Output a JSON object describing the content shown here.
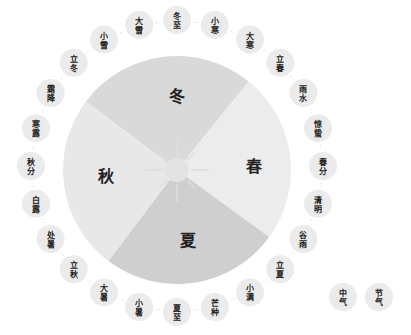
{
  "diagram": {
    "center": {
      "x": 177,
      "y": 170
    },
    "disc_radius": 114,
    "ring": {
      "cx": 177,
      "cy": 166,
      "r": 146,
      "bubble_r": 14
    },
    "colors": {
      "bubble": "#ebebeb",
      "connector": "#d6d6d6",
      "sun": "#e3e3e3",
      "sun_ray": "#dddddd",
      "text": "#222222"
    },
    "seasons": [
      {
        "id": "winter",
        "label": "冬",
        "start_deg": -53,
        "end_deg": 39,
        "color": "#d9d9d9",
        "label_x": 177,
        "label_y": 102
      },
      {
        "id": "spring",
        "label": "春",
        "start_deg": 39,
        "end_deg": 126,
        "color": "#ececec",
        "label_x": 254,
        "label_y": 172
      },
      {
        "id": "summer",
        "label": "夏",
        "start_deg": 126,
        "end_deg": 217,
        "color": "#cfcfcf",
        "label_x": 188,
        "label_y": 246
      },
      {
        "id": "autumn",
        "label": "秋",
        "start_deg": 217,
        "end_deg": 307,
        "color": "#e8e8e8",
        "label_x": 106,
        "label_y": 182
      }
    ],
    "solar_terms": [
      {
        "l1": "冬",
        "l2": "至",
        "type": "中气"
      },
      {
        "l1": "小",
        "l2": "寒",
        "type": "节气"
      },
      {
        "l1": "大",
        "l2": "寒",
        "type": "中气"
      },
      {
        "l1": "立",
        "l2": "春",
        "type": "节气"
      },
      {
        "l1": "雨",
        "l2": "水",
        "type": "中气"
      },
      {
        "l1": "惊",
        "l2": "蛰",
        "type": "节气"
      },
      {
        "l1": "春",
        "l2": "分",
        "type": "中气"
      },
      {
        "l1": "清",
        "l2": "明",
        "type": "节气"
      },
      {
        "l1": "谷",
        "l2": "雨",
        "type": "中气"
      },
      {
        "l1": "立",
        "l2": "夏",
        "type": "节气"
      },
      {
        "l1": "小",
        "l2": "满",
        "type": "中气"
      },
      {
        "l1": "芒",
        "l2": "种",
        "type": "节气"
      },
      {
        "l1": "夏",
        "l2": "至",
        "type": "中气"
      },
      {
        "l1": "小",
        "l2": "暑",
        "type": "节气"
      },
      {
        "l1": "大",
        "l2": "暑",
        "type": "中气"
      },
      {
        "l1": "立",
        "l2": "秋",
        "type": "节气"
      },
      {
        "l1": "处",
        "l2": "暑",
        "type": "中气"
      },
      {
        "l1": "白",
        "l2": "露",
        "type": "节气"
      },
      {
        "l1": "秋",
        "l2": "分",
        "type": "中气"
      },
      {
        "l1": "寒",
        "l2": "露",
        "type": "节气"
      },
      {
        "l1": "霜",
        "l2": "降",
        "type": "中气"
      },
      {
        "l1": "立",
        "l2": "冬",
        "type": "节气"
      },
      {
        "l1": "小",
        "l2": "雪",
        "type": "中气"
      },
      {
        "l1": "大",
        "l2": "雪",
        "type": "节气"
      }
    ]
  },
  "legend": {
    "items": [
      {
        "l1": "中",
        "l2": "气",
        "x": 343,
        "y": 297
      },
      {
        "l1": "节",
        "l2": "气",
        "x": 379,
        "y": 297
      }
    ]
  }
}
